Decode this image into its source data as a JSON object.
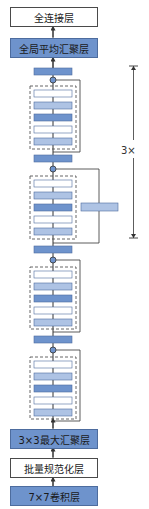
{
  "layers_top": {
    "fc": "全连接层",
    "gap": "全局平均汇聚层"
  },
  "layers_bottom": {
    "maxpool": "3×3最大汇聚层",
    "bn": "批量规范化层",
    "conv": "7×7卷积层"
  },
  "repeat_label": "3×",
  "residual_blocks": [
    {
      "inner_layers": [
        "white",
        "lightblue",
        "blue",
        "white",
        "lightblue"
      ],
      "projection": false
    },
    {
      "inner_layers": [
        "white",
        "lightblue",
        "blue",
        "white",
        "lightblue"
      ],
      "projection": true
    },
    {
      "inner_layers": [
        "white",
        "lightblue",
        "blue",
        "white",
        "lightblue"
      ],
      "projection": false
    },
    {
      "inner_layers": [
        "white",
        "lightblue",
        "blue",
        "white",
        "lightblue"
      ],
      "projection": false
    }
  ],
  "colors": {
    "blue": "#6e93cc",
    "lightblue": "#aec3e4",
    "white": "#ffffff",
    "line": "#333333"
  }
}
